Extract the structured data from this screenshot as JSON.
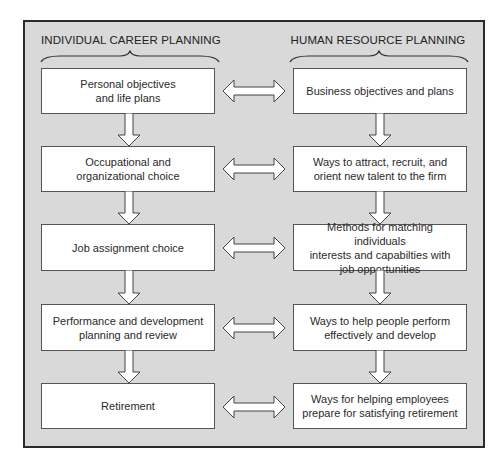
{
  "columns": {
    "left": {
      "title": "INDIVIDUAL CAREER PLANNING"
    },
    "right": {
      "title": "HUMAN RESOURCE PLANNING"
    }
  },
  "rows": [
    {
      "left": "Personal objectives\nand life plans",
      "right": "Business objectives and plans"
    },
    {
      "left": "Occupational and\norganizational choice",
      "right": "Ways to attract, recruit, and\norient new talent to the firm"
    },
    {
      "left": "Job assignment choice",
      "right": "Methods for matching individuals\ninterests and capabilties with\njob opportunities"
    },
    {
      "left": "Performance and development\nplanning and review",
      "right": "Ways to help people perform\neffectively and develop"
    },
    {
      "left": "Retirement",
      "right": "Ways for helping employees\nprepare for satisfying retirement"
    }
  ],
  "colors": {
    "frame_bg": "#d9d9d9",
    "frame_border": "#2b2b2b",
    "box_bg": "#ffffff",
    "box_border": "#555555"
  },
  "icons": {
    "flow_down": "down-arrow-icon",
    "link": "double-arrow-icon",
    "group": "curly-brace-icon"
  }
}
